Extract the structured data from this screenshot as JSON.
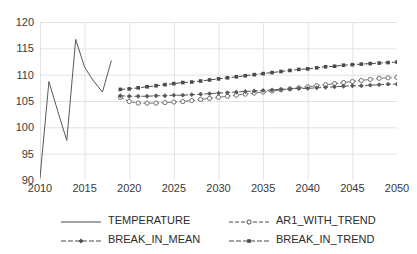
{
  "chart_data": {
    "type": "line",
    "title": "",
    "xlabel": "",
    "ylabel": "",
    "xlim": [
      2010,
      2050
    ],
    "ylim": [
      90,
      120
    ],
    "grid": true,
    "legend_position": "bottom",
    "xticks": [
      2010,
      2015,
      2020,
      2025,
      2030,
      2035,
      2040,
      2045,
      2050
    ],
    "yticks": [
      90,
      95,
      100,
      105,
      110,
      115,
      120
    ],
    "series": [
      {
        "name": "TEMPERATURE",
        "style": "solid",
        "marker": "none",
        "color": "#595959",
        "x": [
          2010,
          2011,
          2012,
          2013,
          2014,
          2015,
          2016,
          2017,
          2018
        ],
        "values": [
          90.4,
          108.7,
          103.0,
          97.5,
          116.7,
          111.4,
          108.8,
          106.7,
          112.7
        ]
      },
      {
        "name": "AR1_WITH_TREND",
        "style": "dashed",
        "marker": "open-circle",
        "color": "#707070",
        "x": [
          2019,
          2020,
          2021,
          2022,
          2023,
          2024,
          2025,
          2026,
          2027,
          2028,
          2029,
          2030,
          2031,
          2032,
          2033,
          2034,
          2035,
          2036,
          2037,
          2038,
          2039,
          2040,
          2041,
          2042,
          2043,
          2044,
          2045,
          2046,
          2047,
          2048,
          2049,
          2050
        ],
        "values": [
          105.7,
          104.9,
          104.6,
          104.6,
          104.6,
          104.7,
          104.8,
          104.9,
          105.1,
          105.3,
          105.5,
          105.7,
          105.9,
          106.1,
          106.3,
          106.5,
          106.7,
          106.9,
          107.1,
          107.3,
          107.5,
          107.7,
          107.9,
          108.1,
          108.3,
          108.5,
          108.7,
          108.9,
          109.1,
          109.3,
          109.4,
          109.5
        ]
      },
      {
        "name": "BREAK_IN_MEAN",
        "style": "dash-dot",
        "marker": "filled-diamond",
        "color": "#5a5a5a",
        "x": [
          2019,
          2020,
          2021,
          2022,
          2023,
          2024,
          2025,
          2026,
          2027,
          2028,
          2029,
          2030,
          2031,
          2032,
          2033,
          2034,
          2035,
          2036,
          2037,
          2038,
          2039,
          2040,
          2041,
          2042,
          2043,
          2044,
          2045,
          2046,
          2047,
          2048,
          2049,
          2050
        ],
        "values": [
          106.0,
          105.9,
          105.9,
          105.9,
          106.0,
          106.0,
          106.1,
          106.1,
          106.2,
          106.3,
          106.4,
          106.5,
          106.6,
          106.7,
          106.8,
          106.9,
          107.0,
          107.1,
          107.2,
          107.3,
          107.4,
          107.4,
          107.5,
          107.6,
          107.7,
          107.8,
          107.9,
          107.9,
          108.0,
          108.1,
          108.2,
          108.2
        ]
      },
      {
        "name": "BREAK_IN_TREND",
        "style": "dash-dot",
        "marker": "filled-square",
        "color": "#4a4a4a",
        "x": [
          2019,
          2020,
          2021,
          2022,
          2023,
          2024,
          2025,
          2026,
          2027,
          2028,
          2029,
          2030,
          2031,
          2032,
          2033,
          2034,
          2035,
          2036,
          2037,
          2038,
          2039,
          2040,
          2041,
          2042,
          2043,
          2044,
          2045,
          2046,
          2047,
          2048,
          2049,
          2050
        ],
        "values": [
          107.2,
          107.3,
          107.5,
          107.7,
          107.9,
          108.1,
          108.3,
          108.5,
          108.6,
          108.8,
          109.0,
          109.2,
          109.4,
          109.6,
          109.8,
          110.0,
          110.2,
          110.4,
          110.6,
          110.8,
          111.0,
          111.1,
          111.3,
          111.5,
          111.6,
          111.8,
          111.9,
          112.0,
          112.1,
          112.2,
          112.3,
          112.4
        ]
      }
    ]
  },
  "legend": {
    "items": [
      {
        "label": "TEMPERATURE",
        "marker": "none",
        "style": "solid"
      },
      {
        "label": "AR1_WITH_TREND",
        "marker": "open-circle",
        "style": "dashed"
      },
      {
        "label": "BREAK_IN_MEAN",
        "marker": "filled-diamond",
        "style": "dash-dot"
      },
      {
        "label": "BREAK_IN_TREND",
        "marker": "filled-square",
        "style": "dash-dot"
      }
    ]
  },
  "colors": {
    "grid": "#e2e2e2",
    "text": "#3a3a3a",
    "background": "#ffffff"
  }
}
